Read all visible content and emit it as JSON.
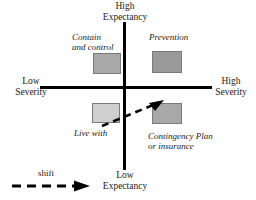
{
  "diagram": {
    "axes": {
      "vertical": {
        "top_label_line1": "High",
        "top_label_line2": "Expectancy",
        "bottom_label_line1": "Low",
        "bottom_label_line2": "Expectancy"
      },
      "horizontal": {
        "left_label_line1": "Low",
        "left_label_line2": "Severity",
        "right_label_line1": "High",
        "right_label_line2": "Severity"
      }
    },
    "quadrants": [
      {
        "id": "top-left",
        "caption_line1": "Contain",
        "caption_line2": "and control",
        "box_color": "#a8a8a8"
      },
      {
        "id": "top-right",
        "caption_line1": "Prevention",
        "caption_line2": "",
        "box_color": "#9a9a9a"
      },
      {
        "id": "bottom-left",
        "caption_line1": "Live with",
        "caption_line2": "",
        "box_color": "#cfcfcf"
      },
      {
        "id": "bottom-right",
        "caption_line1": "Contingency Plan",
        "caption_line2": "or insurance",
        "box_color": "#a8a8a8"
      }
    ],
    "legend": {
      "label": "shift",
      "style": "dashed-arrow"
    },
    "colors": {
      "line": "#000000",
      "text": "#1a1a1a",
      "background": "#ffffff",
      "box_border": "#7a7a7a"
    }
  }
}
